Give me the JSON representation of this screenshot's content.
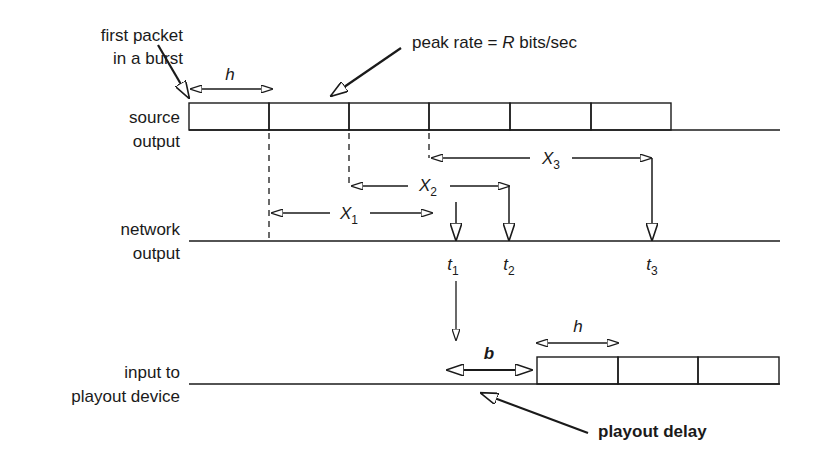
{
  "diagram": {
    "labels": {
      "first_packet_line1": "first packet",
      "first_packet_line2": "in a burst",
      "peak_rate_prefix": "peak rate = ",
      "peak_rate_var": "R",
      "peak_rate_suffix": " bits/sec",
      "source_line1": "source",
      "source_line2": "output",
      "network_line1": "network",
      "network_line2": "output",
      "playout_line1": "input to",
      "playout_line2": "playout device",
      "playout_delay": "playout delay",
      "h_top": "h",
      "h_bottom": "h",
      "b": "b"
    },
    "intervals": [
      {
        "var": "X",
        "sub": "1"
      },
      {
        "var": "X",
        "sub": "2"
      },
      {
        "var": "X",
        "sub": "3"
      }
    ],
    "times": [
      {
        "var": "t",
        "sub": "1"
      },
      {
        "var": "t",
        "sub": "2"
      },
      {
        "var": "t",
        "sub": "3"
      }
    ],
    "source_packets": 6,
    "playout_packets": 3,
    "colors": {
      "stroke": "#1a1a1a",
      "background": "#ffffff"
    }
  }
}
